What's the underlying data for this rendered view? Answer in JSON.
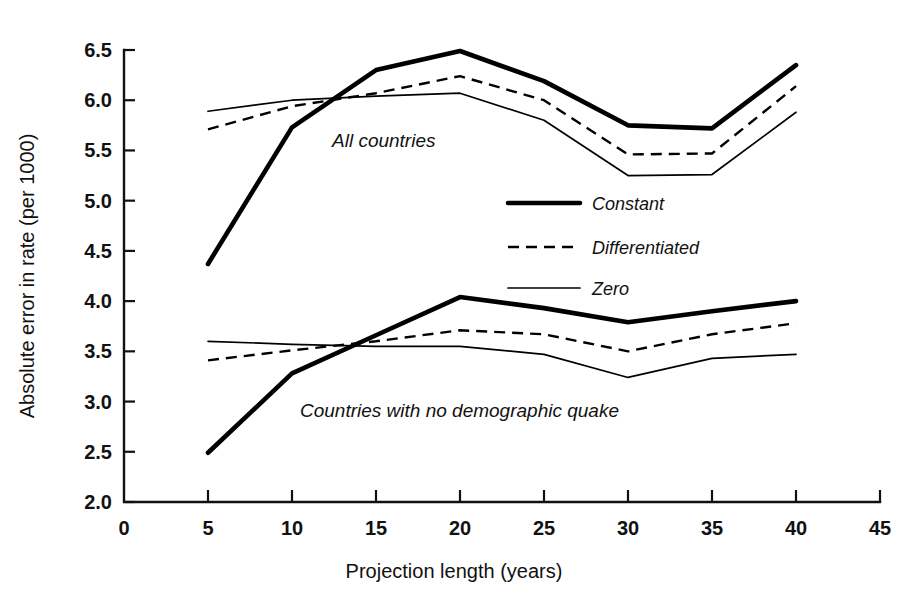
{
  "chart_data": {
    "type": "line",
    "title": "",
    "xlabel": "Projection length (years)",
    "ylabel": "Absolute error in rate (per 1000)",
    "xlim": [
      0,
      45
    ],
    "ylim": [
      2.0,
      6.5
    ],
    "xticks": [
      0,
      5,
      10,
      15,
      20,
      25,
      30,
      35,
      40,
      45
    ],
    "xtick_labels": [
      "0",
      "5",
      "10",
      "15",
      "20",
      "25",
      "30",
      "35",
      "40",
      "45"
    ],
    "yticks": [
      2.0,
      2.5,
      3.0,
      3.5,
      4.0,
      4.5,
      5.0,
      5.5,
      6.0,
      6.5
    ],
    "ytick_labels": [
      "2.0",
      "2.5",
      "3.0",
      "3.5",
      "4.0",
      "4.5",
      "5.0",
      "5.5",
      "6.0",
      "6.5"
    ],
    "grid": false,
    "legend_position": "center-right",
    "x": [
      5,
      10,
      15,
      20,
      25,
      30,
      35,
      40
    ],
    "groups": [
      {
        "name": "All countries",
        "annotation": "All countries",
        "series": [
          {
            "name": "Constant",
            "style": "solid-thick",
            "values": [
              4.37,
              5.73,
              6.3,
              6.49,
              6.19,
              5.75,
              5.72,
              6.35
            ]
          },
          {
            "name": "Differentiated",
            "style": "dashed",
            "values": [
              5.71,
              5.94,
              6.07,
              6.24,
              6.0,
              5.46,
              5.47,
              6.14
            ]
          },
          {
            "name": "Zero",
            "style": "solid-thin",
            "values": [
              5.89,
              6.0,
              6.04,
              6.07,
              5.8,
              5.25,
              5.26,
              5.88
            ]
          }
        ]
      },
      {
        "name": "Countries with no demographic quake",
        "annotation": "Countries with no demographic quake",
        "series": [
          {
            "name": "Constant",
            "style": "solid-thick",
            "values": [
              2.49,
              3.28,
              3.66,
              4.04,
              3.93,
              3.79,
              3.9,
              4.0
            ]
          },
          {
            "name": "Differentiated",
            "style": "dashed",
            "values": [
              3.41,
              3.51,
              3.6,
              3.71,
              3.67,
              3.5,
              3.67,
              3.78
            ]
          },
          {
            "name": "Zero",
            "style": "solid-thin",
            "values": [
              3.6,
              3.57,
              3.55,
              3.55,
              3.47,
              3.24,
              3.43,
              3.47
            ]
          }
        ]
      }
    ],
    "legend": [
      {
        "label": "Constant",
        "style": "solid-thick"
      },
      {
        "label": "Differentiated",
        "style": "dashed"
      },
      {
        "label": "Zero",
        "style": "solid-thin"
      }
    ]
  }
}
